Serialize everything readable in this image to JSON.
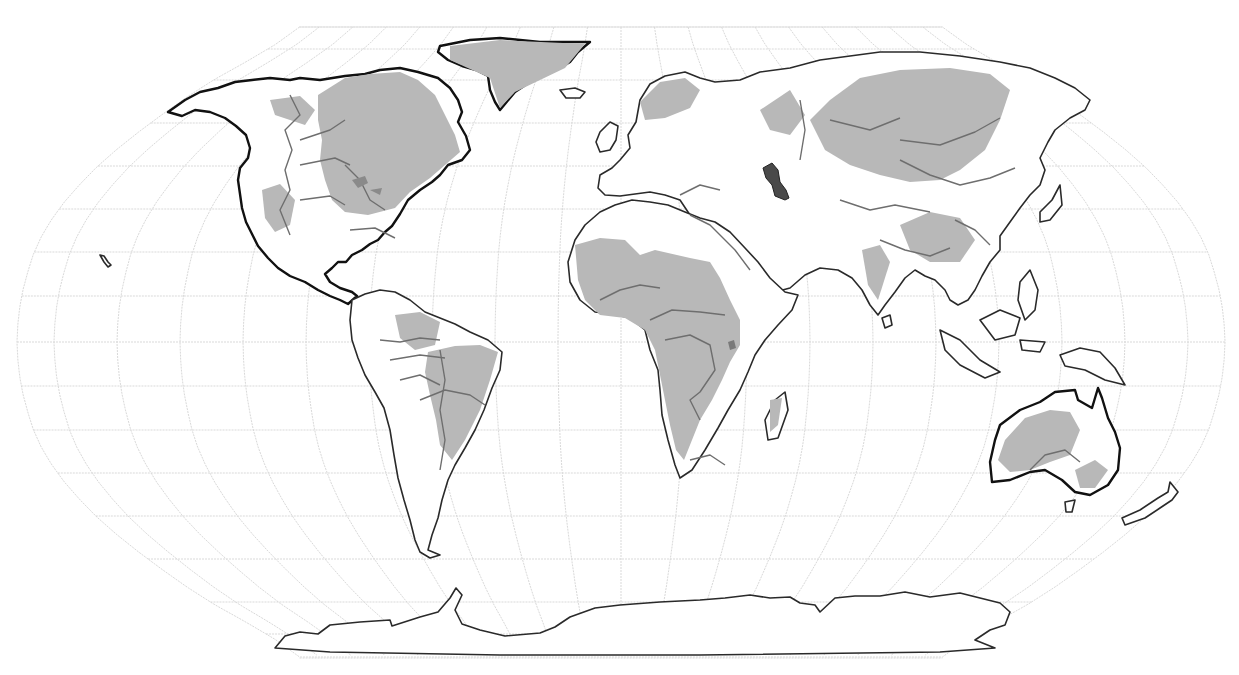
{
  "map": {
    "projection": "Robinson",
    "width": 1239,
    "height": 675,
    "center_x": 621,
    "equator_y": 342,
    "half_width": 604,
    "graticule": {
      "parallels_y": [
        27,
        49,
        80,
        123,
        166,
        209,
        252,
        296,
        342,
        386,
        430,
        473,
        516,
        559,
        602,
        634,
        658
      ],
      "meridian_step_px": 63,
      "meridian_count_each_side": 9
    },
    "colors": {
      "background": "#ffffff",
      "graticule": "#d9d9d9",
      "land_fill": "#ffffff",
      "coastline": "#2a2a2a",
      "shaded_region": "#b8b8b8",
      "basin_boundary": "#6e6e6e",
      "highlight_water_body": "#4a4a4a"
    },
    "layers": [
      {
        "name": "graticule",
        "icon": "grid-icon"
      },
      {
        "name": "coastlines",
        "icon": "coastline-icon"
      },
      {
        "name": "shaded-regions",
        "icon": "shade-icon"
      },
      {
        "name": "basin-boundaries",
        "icon": "boundary-icon"
      },
      {
        "name": "caspian-sea-highlight",
        "icon": "lake-icon"
      }
    ]
  }
}
